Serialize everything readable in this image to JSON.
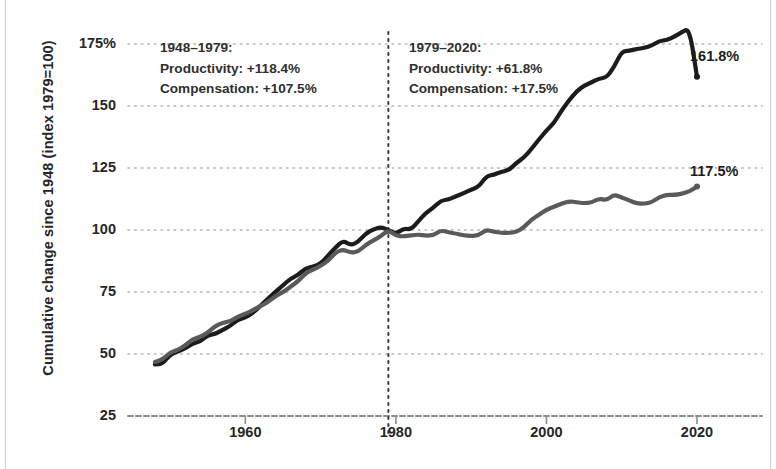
{
  "chart_data": {
    "type": "line",
    "title": "",
    "xlabel": "",
    "ylabel": "Cumulative change since 1948 (index 1979=100)",
    "xlim": [
      1948,
      2020
    ],
    "ylim": [
      25,
      175
    ],
    "grid": true,
    "legend": "none",
    "yticks": [
      {
        "value": 175,
        "label": "175%"
      },
      {
        "value": 150,
        "label": "150"
      },
      {
        "value": 125,
        "label": "125"
      },
      {
        "value": 100,
        "label": "100"
      },
      {
        "value": 75,
        "label": "75"
      },
      {
        "value": 50,
        "label": "50"
      },
      {
        "value": 25,
        "label": "25"
      }
    ],
    "xticks": [
      {
        "value": 1960,
        "label": "1960"
      },
      {
        "value": 1980,
        "label": "1980"
      },
      {
        "value": 2000,
        "label": "2000"
      },
      {
        "value": 2020,
        "label": "2020"
      }
    ],
    "reference_line": {
      "x": 1979,
      "style": "dotted",
      "color": "#3a3a3a"
    },
    "series": [
      {
        "name": "Productivity",
        "color": "#1c1c1c",
        "width": 4.2,
        "endpoint_label": "161.8%",
        "x": [
          1948,
          1949,
          1950,
          1951,
          1952,
          1953,
          1954,
          1955,
          1956,
          1957,
          1958,
          1959,
          1960,
          1961,
          1962,
          1963,
          1964,
          1965,
          1966,
          1967,
          1968,
          1969,
          1970,
          1971,
          1972,
          1973,
          1974,
          1975,
          1976,
          1977,
          1978,
          1979,
          1980,
          1981,
          1982,
          1983,
          1984,
          1985,
          1986,
          1987,
          1988,
          1989,
          1990,
          1991,
          1992,
          1993,
          1994,
          1995,
          1996,
          1997,
          1998,
          1999,
          2000,
          2001,
          2002,
          2003,
          2004,
          2005,
          2006,
          2007,
          2008,
          2009,
          2010,
          2011,
          2012,
          2013,
          2014,
          2015,
          2016,
          2017,
          2018,
          2019,
          2020
        ],
        "values": [
          45.8,
          46.1,
          49.8,
          51.0,
          52.2,
          54.2,
          55.0,
          57.6,
          58.0,
          59.8,
          61.3,
          63.9,
          64.6,
          66.6,
          69.4,
          72.3,
          75.1,
          77.7,
          80.4,
          81.8,
          84.6,
          85.2,
          86.3,
          89.7,
          93.0,
          95.8,
          93.8,
          95.2,
          98.6,
          100.3,
          101.2,
          100.0,
          98.4,
          100.6,
          100.2,
          103.6,
          107.0,
          109.0,
          111.9,
          112.3,
          113.6,
          114.8,
          116.3,
          117.4,
          121.6,
          122.3,
          123.5,
          124.1,
          127.0,
          129.2,
          132.6,
          136.5,
          140.1,
          143.1,
          148.2,
          152.3,
          155.9,
          158.2,
          159.5,
          161.1,
          161.5,
          165.8,
          172.0,
          172.3,
          173.0,
          173.4,
          174.4,
          176.2,
          176.6,
          178.0,
          179.8,
          181.3,
          161.8
        ]
      },
      {
        "name": "Compensation",
        "color": "#5a5a5a",
        "width": 4.2,
        "endpoint_label": "117.5%",
        "x": [
          1948,
          1949,
          1950,
          1951,
          1952,
          1953,
          1954,
          1955,
          1956,
          1957,
          1958,
          1959,
          1960,
          1961,
          1962,
          1963,
          1964,
          1965,
          1966,
          1967,
          1968,
          1969,
          1970,
          1971,
          1972,
          1973,
          1974,
          1975,
          1976,
          1977,
          1978,
          1979,
          1980,
          1981,
          1982,
          1983,
          1984,
          1985,
          1986,
          1987,
          1988,
          1989,
          1990,
          1991,
          1992,
          1993,
          1994,
          1995,
          1996,
          1997,
          1998,
          1999,
          2000,
          2001,
          2002,
          2003,
          2004,
          2005,
          2006,
          2007,
          2008,
          2009,
          2010,
          2011,
          2012,
          2013,
          2014,
          2015,
          2016,
          2017,
          2018,
          2019,
          2020
        ],
        "values": [
          46.8,
          47.8,
          50.6,
          51.6,
          53.4,
          56.0,
          56.8,
          58.6,
          61.3,
          62.6,
          63.2,
          65.1,
          66.2,
          67.6,
          69.4,
          70.9,
          73.3,
          74.9,
          77.1,
          79.3,
          82.6,
          84.0,
          85.5,
          87.6,
          91.0,
          92.2,
          90.8,
          91.3,
          94.0,
          95.8,
          97.5,
          100.0,
          97.7,
          97.4,
          97.8,
          98.2,
          97.7,
          97.9,
          99.9,
          99.0,
          98.6,
          97.8,
          97.6,
          97.9,
          100.1,
          99.3,
          98.9,
          98.8,
          99.2,
          101.0,
          104.2,
          106.1,
          108.2,
          109.4,
          110.6,
          111.6,
          111.2,
          110.8,
          111.1,
          112.7,
          112.0,
          114.3,
          113.2,
          111.9,
          110.7,
          110.6,
          111.2,
          113.3,
          114.2,
          114.1,
          114.6,
          115.6,
          117.5
        ]
      }
    ],
    "annotations": [
      {
        "id": "period-1948-1979",
        "lines": [
          "1948–1979:",
          "Productivity: +118.4%",
          "Compensation: +107.5%"
        ]
      },
      {
        "id": "period-1979-2020",
        "lines": [
          "1979–2020:",
          "Productivity: +61.8%",
          "Compensation: +17.5%"
        ]
      }
    ]
  },
  "colors": {
    "productivity": "#1c1c1c",
    "compensation": "#5a5a5a",
    "grid": "#b6b6b6",
    "axis": "#8d8d8d",
    "text": "#262626"
  }
}
